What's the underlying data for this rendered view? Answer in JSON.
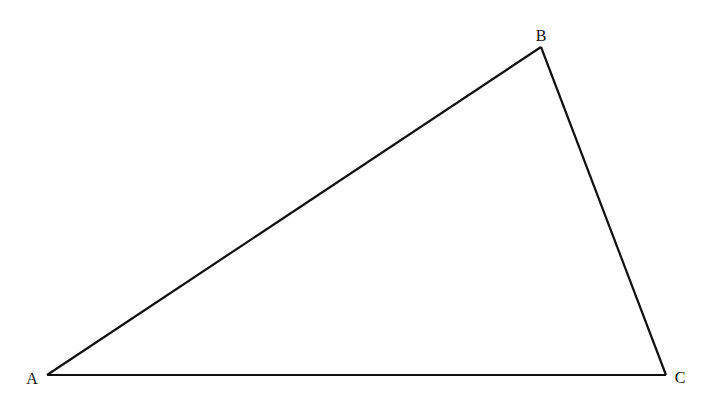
{
  "diagram": {
    "type": "triangle",
    "stroke_color": "#111111",
    "background": "#ffffff",
    "vertices": [
      {
        "name": "A",
        "label": "A",
        "x": 47,
        "y": 375,
        "label_x": 32,
        "label_y": 384
      },
      {
        "name": "B",
        "label": "B",
        "x": 541,
        "y": 47,
        "label_x": 541,
        "label_y": 41
      },
      {
        "name": "C",
        "label": "C",
        "x": 666,
        "y": 375,
        "label_x": 680,
        "label_y": 383
      }
    ],
    "edges": [
      {
        "from": "A",
        "to": "B"
      },
      {
        "from": "B",
        "to": "C"
      },
      {
        "from": "C",
        "to": "A"
      }
    ]
  }
}
